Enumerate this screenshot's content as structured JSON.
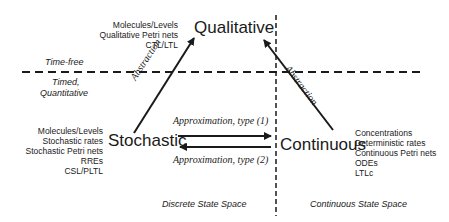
{
  "nodes": {
    "qualitative": {
      "label": "Qualitative",
      "properties": [
        "Molecules/Levels",
        "Qualitative Petri nets",
        "CTL/LTL"
      ]
    },
    "stochastic": {
      "label": "Stochastic",
      "properties": [
        "Molecules/Levels",
        "Stochastic rates",
        "Stochastic Petri nets",
        "RREs",
        "CSL/PLTL"
      ]
    },
    "continuous": {
      "label": "Continuous",
      "properties": [
        "Concentrations",
        "Deterministic rates",
        "Continuous Petri nets",
        "ODEs",
        "LTLc"
      ]
    }
  },
  "edges": {
    "stochastic_to_qualitative": "Abstraction",
    "continuous_to_qualitative": "Abstraction",
    "stochastic_to_continuous": "Approximation, type (1)",
    "continuous_to_stochastic": "Approximation, type (2)"
  },
  "regions": {
    "upper": "Time-free",
    "lower_line1": "Timed,",
    "lower_line2": "Quantitative",
    "left": "Discrete State Space",
    "right": "Continuous State Space"
  },
  "colors": {
    "line": "#1a1a1a",
    "text": "#1a1a1a",
    "background": "#ffffff"
  }
}
